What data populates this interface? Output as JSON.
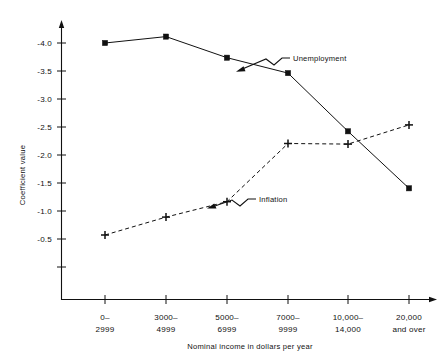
{
  "chart_data": {
    "type": "line",
    "title": "",
    "xlabel": "Nominal income in dollars per year",
    "ylabel": "Coefficient value",
    "categories": [
      "0–\n2999",
      "3000–\n4999",
      "5000–\n6999",
      "7000–\n9999",
      "10,000–\n14,000",
      "20,000\nand over"
    ],
    "category_lines": [
      [
        "0–",
        "2999"
      ],
      [
        "3000–",
        "4999"
      ],
      [
        "5000–",
        "6999"
      ],
      [
        "7000–",
        "9999"
      ],
      [
        "10,000–",
        "14,000"
      ],
      [
        "20,000",
        "and over"
      ]
    ],
    "ylim": [
      -0.25,
      -4.3
    ],
    "yticks": [
      -4.0,
      -3.5,
      -3.0,
      -2.5,
      -2.0,
      -1.5,
      -1.0,
      -0.5
    ],
    "ytick_labels": [
      "-4.0",
      "-3.5",
      "-3.0",
      "-2.5",
      "-2.0",
      "-1.5",
      "-1.0",
      "-0.5"
    ],
    "grid": false,
    "legend": "inline-annotations",
    "series": [
      {
        "name": "Unemployment",
        "style": "solid",
        "marker": "square",
        "values": [
          -4.0,
          -4.1,
          -3.77,
          -3.53,
          -2.62,
          -1.73
        ]
      },
      {
        "name": "Inflation",
        "style": "dashed",
        "marker": "plus",
        "values": [
          -1.0,
          -1.28,
          -1.52,
          -2.43,
          -2.42,
          -2.72
        ]
      }
    ],
    "annotations": [
      {
        "text": "Unemployment",
        "points_to_series": "Unemployment"
      },
      {
        "text": "Inflation",
        "points_to_series": "Inflation"
      }
    ],
    "colors": {
      "ink": "#111111",
      "background": "#ffffff"
    }
  }
}
